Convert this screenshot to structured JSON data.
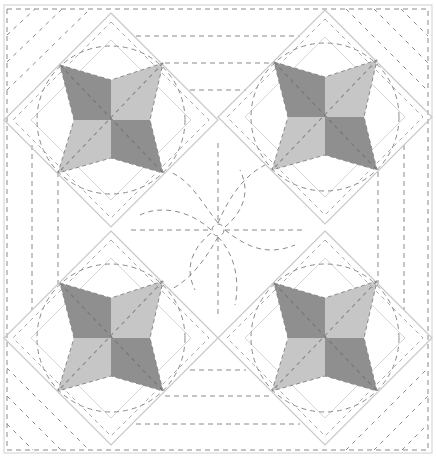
{
  "diagram": {
    "type": "quilt-pattern",
    "colors": {
      "background": "#ffffff",
      "seam_line": "#c8c8c8",
      "stitch_line": "#8a8a8a",
      "dark_fabric": "#8f8f8f",
      "light_fabric": "#c6c6c6"
    },
    "frame": {
      "x": 7,
      "y": 8,
      "width": 421,
      "height": 442
    },
    "stars": [
      {
        "name": "star-top-left",
        "cx": 111,
        "cy": 120
      },
      {
        "name": "star-top-right",
        "cx": 325,
        "cy": 117
      },
      {
        "name": "star-bottom-left",
        "cx": 111,
        "cy": 338
      },
      {
        "name": "star-bottom-right",
        "cx": 325,
        "cy": 338
      }
    ],
    "center_motif": {
      "name": "pinwheel-quilting",
      "cx": 218,
      "cy": 230,
      "petals": 8
    }
  }
}
